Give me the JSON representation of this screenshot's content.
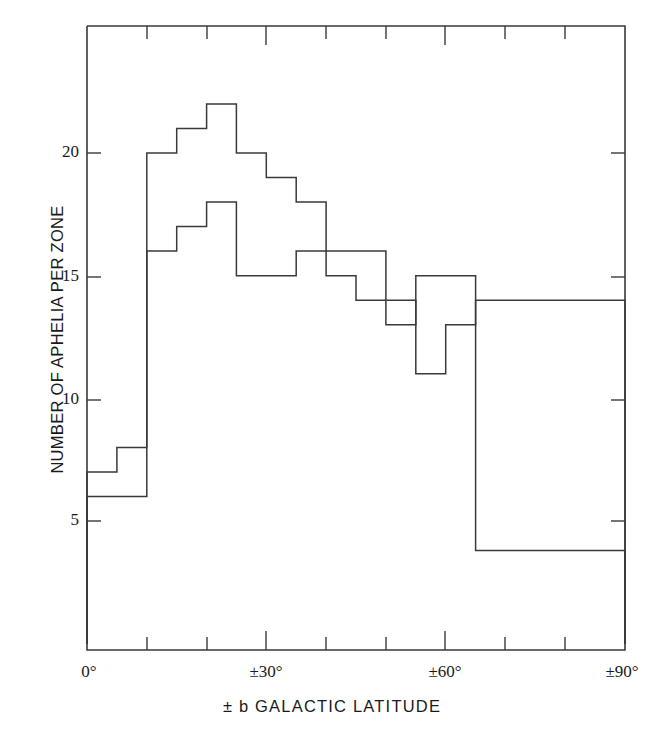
{
  "figure": {
    "background_color": "#ffffff",
    "line_color": "#3a3a3a"
  },
  "axes": {
    "y_label": "NUMBER OF APHELIA PER ZONE",
    "x_label": "± b  GALACTIC  LATITUDE",
    "y_ticks": [
      {
        "value": 5,
        "label": "5"
      },
      {
        "value": 10,
        "label": "10"
      },
      {
        "value": 15,
        "label": "15"
      },
      {
        "value": 20,
        "label": "20"
      }
    ],
    "x_ticks_major": [
      {
        "value": 0,
        "label": "0°"
      },
      {
        "value": 30,
        "label": "±30°"
      },
      {
        "value": 60,
        "label": "±60°"
      },
      {
        "value": 90,
        "label": "±90°"
      }
    ],
    "x_ticks_minor": [
      10,
      20,
      40,
      50,
      70,
      80
    ]
  },
  "chart_data": {
    "type": "line",
    "title": "",
    "subtitle": "",
    "xlabel": "± b  GALACTIC  LATITUDE",
    "ylabel": "NUMBER OF APHELIA PER ZONE",
    "xlim": [
      0,
      90
    ],
    "ylim": [
      0,
      24.5
    ],
    "grid": false,
    "legend": "none",
    "bin_width_deg": 5,
    "bin_edges": [
      0,
      5,
      10,
      15,
      20,
      25,
      30,
      35,
      40,
      45,
      50,
      55,
      60,
      65,
      90
    ],
    "series": [
      {
        "name": "upper-histogram",
        "values": [
          7,
          8,
          20,
          21,
          22,
          20,
          19,
          18,
          16,
          16,
          13,
          15,
          15,
          3.8
        ]
      },
      {
        "name": "lower-histogram",
        "values": [
          6,
          6,
          16,
          17,
          18,
          15,
          15,
          16,
          15,
          14,
          14,
          11,
          13,
          14
        ]
      }
    ]
  }
}
